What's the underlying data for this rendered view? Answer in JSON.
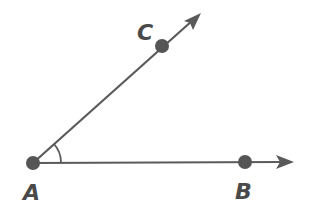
{
  "diagram": {
    "type": "angle",
    "vertex": {
      "label": "A",
      "x": 33,
      "y": 163
    },
    "points": [
      {
        "label": "A",
        "x": 33,
        "y": 163
      },
      {
        "label": "B",
        "x": 245,
        "y": 162
      },
      {
        "label": "C",
        "x": 162,
        "y": 46
      }
    ],
    "rays": [
      {
        "name": "AB",
        "from": "A",
        "through": "B",
        "end": [
          293,
          162
        ]
      },
      {
        "name": "AC",
        "from": "A",
        "through": "C",
        "end": [
          200,
          14
        ]
      }
    ],
    "angle_mark": {
      "at": "A",
      "between": [
        "AB",
        "AC"
      ]
    },
    "colors": {
      "stroke": "#5a5a5a",
      "point": "#555555",
      "label": "#4a4a4a",
      "background": "#ffffff"
    }
  }
}
